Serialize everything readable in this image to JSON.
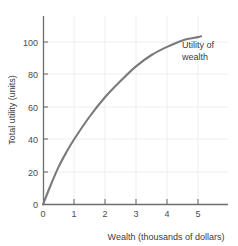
{
  "chart_data": {
    "type": "line",
    "title": "",
    "subtitle": "",
    "xlabel": "Wealth (thousands of dollars)",
    "ylabel": "Total utility (units)",
    "xlim": [
      0,
      6
    ],
    "ylim": [
      0,
      115
    ],
    "grid": true,
    "legend_position": "none",
    "x_ticks": [
      "0",
      "1",
      "2",
      "3",
      "4",
      "5"
    ],
    "x_tick_values": [
      0,
      1,
      2,
      3,
      4,
      5
    ],
    "y_ticks": [
      "0",
      "20",
      "40",
      "60",
      "80",
      "100"
    ],
    "y_tick_values": [
      0,
      20,
      40,
      60,
      80,
      100
    ],
    "series": [
      {
        "name": "Utility of wealth",
        "color": "#7a7a7a",
        "x": [
          0,
          0.25,
          0.5,
          0.75,
          1,
          1.5,
          2,
          2.5,
          3,
          3.5,
          4,
          4.5,
          5,
          5.1
        ],
        "values": [
          0,
          12,
          23,
          32,
          40,
          54,
          66,
          76,
          85,
          92,
          97,
          101,
          103,
          103.5
        ]
      }
    ],
    "annotations": [
      {
        "name": "curve-label",
        "line1": "Utility of",
        "line2": "wealth",
        "x": 4.7,
        "y": 96
      }
    ]
  },
  "axes": {
    "y_title": "Total utility (units)",
    "x_title": "Wealth (thousands of dollars)"
  },
  "colors": {
    "curve": "#7a7a7a",
    "axis": "#6e6e6e",
    "grid": "#e9eef2",
    "text": "#3c3c3c",
    "background": "#ffffff"
  }
}
